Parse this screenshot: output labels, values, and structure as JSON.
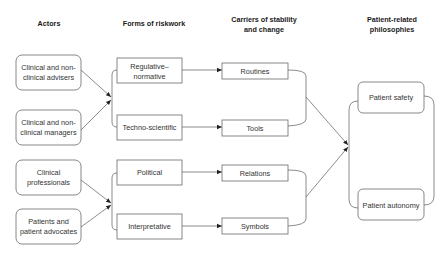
{
  "headers": {
    "actors": "Actors",
    "forms": "Forms of riskwork",
    "carriers_line1": "Carriers of stability",
    "carriers_line2": "and change",
    "philosophies_line1": "Patient-related",
    "philosophies_line2": "philosophies"
  },
  "actors": [
    {
      "line1": "Clinical and non-",
      "line2": "clinical advisers"
    },
    {
      "line1": "Clinical and non-",
      "line2": "clinical managers"
    },
    {
      "line1": "Clinical",
      "line2": "professionals"
    },
    {
      "line1": "Patients and",
      "line2": "patient advocates"
    }
  ],
  "forms": [
    {
      "line1": "Regulative–",
      "line2": "normative"
    },
    {
      "line1": "Techno-scientific",
      "line2": ""
    },
    {
      "line1": "Political",
      "line2": ""
    },
    {
      "line1": "Interpretative",
      "line2": ""
    }
  ],
  "carriers": [
    {
      "label": "Routines"
    },
    {
      "label": "Tools"
    },
    {
      "label": "Relations"
    },
    {
      "label": "Symbols"
    }
  ],
  "philosophies": [
    {
      "label": "Patient safety"
    },
    {
      "label": "Patient autonomy"
    }
  ],
  "colors": {
    "stroke": "#6a6a6a",
    "text": "#333333",
    "background": "#ffffff"
  }
}
